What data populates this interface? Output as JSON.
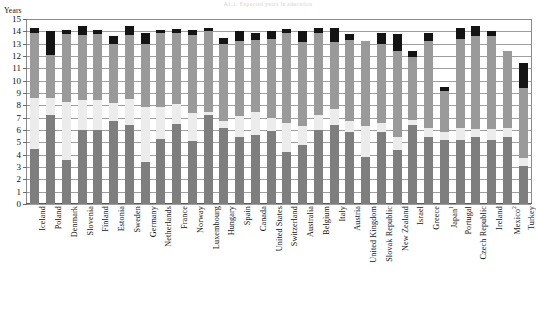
{
  "header": {
    "top_title": "A1.1. Expected years in education",
    "y_axis_unit": "Years"
  },
  "chart_data": {
    "type": "bar",
    "stacked": true,
    "title": "A1.1. Expected years in education",
    "xlabel": "",
    "ylabel": "Years",
    "ylim": [
      0,
      15
    ],
    "ytick_labels": [
      "0",
      "1",
      "2",
      "3",
      "4",
      "5",
      "6",
      "7",
      "8",
      "9",
      "10",
      "11",
      "12",
      "13",
      "14",
      "15"
    ],
    "grid": true,
    "legend_position": "none",
    "series": [
      {
        "name": "primary-and-lower",
        "color": "#7e7e7e"
      },
      {
        "name": "secondary",
        "color": "#ececec"
      },
      {
        "name": "tertiary-and-upper",
        "color": "#9a9a9a"
      },
      {
        "name": "other-not-allocated",
        "color": "#141414"
      }
    ],
    "categories": [
      "Iceland",
      "Poland",
      "Denmark",
      "Slovenia",
      "Finland",
      "Estonia",
      "Sweden",
      "Germany",
      "Netherlands",
      "France",
      "Norway",
      "Luxembourg",
      "Hungary",
      "Spain",
      "Canada",
      "United States",
      "Switzerland",
      "Australia",
      "Belgium",
      "Italy",
      "Austria",
      "United Kingdom",
      "Slovak Republic",
      "New Zealand",
      "Israel",
      "Greece",
      "Japan",
      "Portugal",
      "Czech Republic",
      "Ireland",
      "Mexico",
      "Turkey"
    ],
    "category_footnotes": {
      "Japan": "1",
      "Mexico": "2"
    },
    "bars": [
      {
        "country": "Iceland",
        "values": [
          4.5,
          4.1,
          5.3,
          0.4
        ],
        "total": 14.3
      },
      {
        "country": "Poland",
        "values": [
          7.2,
          1.4,
          3.5,
          1.9
        ],
        "total": 14.0
      },
      {
        "country": "Denmark",
        "values": [
          3.6,
          4.7,
          5.5,
          0.3
        ],
        "total": 14.1
      },
      {
        "country": "Slovenia",
        "values": [
          6.0,
          2.4,
          5.3,
          0.7
        ],
        "total": 14.4
      },
      {
        "country": "Finland",
        "values": [
          6.0,
          2.4,
          5.4,
          0.3
        ],
        "total": 14.1
      },
      {
        "country": "Estonia",
        "values": [
          6.7,
          1.5,
          4.8,
          0.6
        ],
        "total": 13.6
      },
      {
        "country": "Sweden",
        "values": [
          6.4,
          2.1,
          5.2,
          0.7
        ],
        "total": 14.4
      },
      {
        "country": "Germany",
        "values": [
          3.4,
          4.5,
          5.1,
          0.9
        ],
        "total": 13.9
      },
      {
        "country": "Netherlands",
        "values": [
          5.3,
          2.6,
          6.0,
          0.2
        ],
        "total": 14.1
      },
      {
        "country": "France",
        "values": [
          6.5,
          1.6,
          5.8,
          0.3
        ],
        "total": 14.2
      },
      {
        "country": "Norway",
        "values": [
          5.1,
          2.3,
          6.3,
          0.4
        ],
        "total": 14.1
      },
      {
        "country": "Luxembourg",
        "values": [
          7.2,
          0.3,
          6.5,
          0.3
        ],
        "total": 14.3
      },
      {
        "country": "Hungary",
        "values": [
          6.2,
          0.5,
          6.3,
          0.5
        ],
        "total": 13.5
      },
      {
        "country": "Spain",
        "values": [
          5.4,
          1.7,
          6.1,
          0.8
        ],
        "total": 14.0
      },
      {
        "country": "Canada",
        "values": [
          5.6,
          1.9,
          5.8,
          0.6
        ],
        "total": 13.9
      },
      {
        "country": "United States",
        "values": [
          5.9,
          1.1,
          6.4,
          0.6
        ],
        "total": 14.0
      },
      {
        "country": "Switzerland",
        "values": [
          4.2,
          2.4,
          7.3,
          0.3
        ],
        "total": 14.2
      },
      {
        "country": "Australia",
        "values": [
          4.8,
          1.5,
          6.8,
          0.9
        ],
        "total": 14.0
      },
      {
        "country": "Belgium",
        "values": [
          6.0,
          1.2,
          6.7,
          0.4
        ],
        "total": 14.3
      },
      {
        "country": "Italy",
        "values": [
          6.4,
          1.3,
          5.4,
          1.2
        ],
        "total": 14.3
      },
      {
        "country": "Austria",
        "values": [
          5.8,
          0.9,
          6.6,
          0.5
        ],
        "total": 13.8
      },
      {
        "country": "United Kingdom",
        "values": [
          3.8,
          2.5,
          6.9,
          0.0
        ],
        "total": 13.2
      },
      {
        "country": "Slovak Republic",
        "values": [
          5.8,
          0.8,
          6.4,
          0.9
        ],
        "total": 13.9
      },
      {
        "country": "New Zealand",
        "values": [
          4.4,
          1.0,
          7.0,
          1.4
        ],
        "total": 13.8
      },
      {
        "country": "Israel",
        "values": [
          6.4,
          0.4,
          5.1,
          0.5
        ],
        "total": 12.4
      },
      {
        "country": "Greece",
        "values": [
          5.4,
          0.8,
          7.0,
          0.7
        ],
        "total": 13.9
      },
      {
        "country": "Japan",
        "values": [
          5.2,
          0.6,
          3.4,
          0.3
        ],
        "total": 9.5
      },
      {
        "country": "Portugal",
        "values": [
          5.2,
          1.0,
          7.2,
          0.9
        ],
        "total": 14.3
      },
      {
        "country": "Czech Republic",
        "values": [
          5.4,
          0.7,
          7.5,
          0.8
        ],
        "total": 14.4
      },
      {
        "country": "Ireland",
        "values": [
          5.2,
          0.9,
          7.5,
          0.4
        ],
        "total": 14.0
      },
      {
        "country": "Mexico",
        "values": [
          5.4,
          0.8,
          6.2,
          0.0
        ],
        "total": 12.4
      },
      {
        "country": "Turkey",
        "values": [
          3.1,
          0.6,
          5.7,
          2.0
        ],
        "total": 11.4
      }
    ]
  }
}
